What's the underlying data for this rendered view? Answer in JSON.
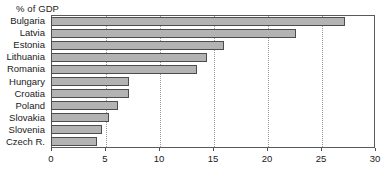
{
  "chart_data": {
    "type": "bar",
    "orientation": "horizontal",
    "title": "",
    "subtitle": "",
    "axis_note": "% of GDP",
    "xlabel": "",
    "ylabel": "",
    "xlim": [
      0,
      30
    ],
    "xticks": [
      0,
      5,
      10,
      15,
      20,
      25,
      30
    ],
    "xtick_labels": [
      "0",
      "5",
      "10",
      "15",
      "20",
      "25",
      "30"
    ],
    "grid": true,
    "grid_axis": "x",
    "legend": false,
    "categories": [
      "Bulgaria",
      "Latvia",
      "Estonia",
      "Lithuania",
      "Romania",
      "Hungary",
      "Croatia",
      "Poland",
      "Slovakia",
      "Slovenia",
      "Czech R."
    ],
    "values": [
      27.2,
      22.7,
      16.0,
      14.4,
      13.5,
      7.2,
      7.2,
      6.2,
      5.4,
      4.7,
      4.3
    ],
    "series": [
      {
        "name": "% of GDP",
        "values": [
          27.2,
          22.7,
          16.0,
          14.4,
          13.5,
          7.2,
          7.2,
          6.2,
          5.4,
          4.7,
          4.3
        ]
      }
    ]
  },
  "style": {
    "bar_fill": "#b3b3b3",
    "bar_border": "#4d4d4d",
    "grid_color": "#9a9a9a",
    "frame_color": "#5a5a5a",
    "text_color": "#1a1a1a",
    "background": "#ffffff"
  }
}
